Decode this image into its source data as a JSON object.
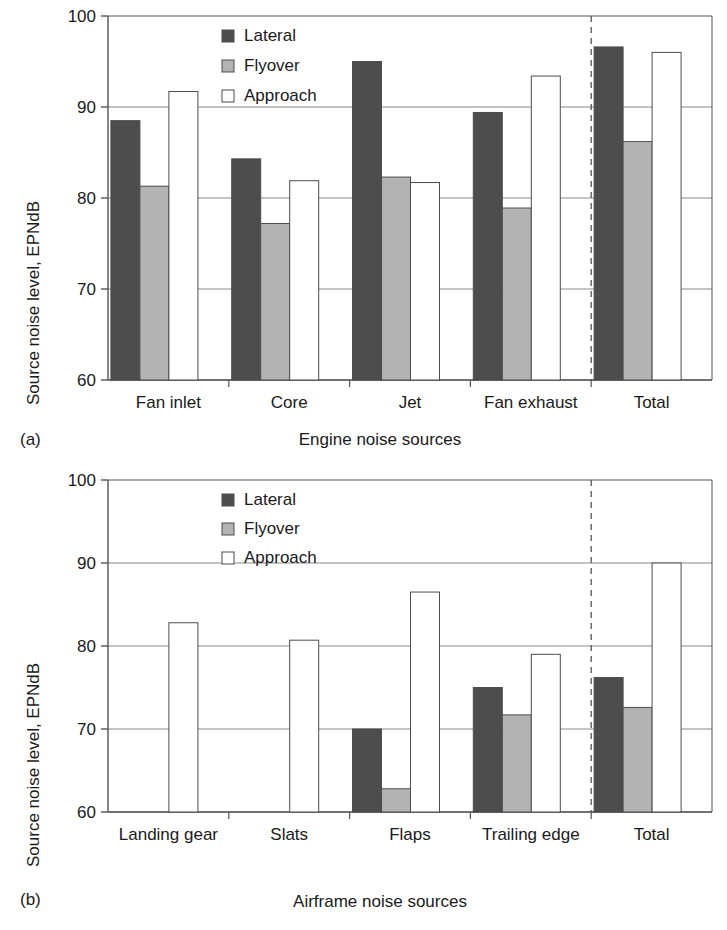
{
  "figure": {
    "panels": [
      {
        "tag": "(a)",
        "xlabel": "Engine noise sources",
        "ylabel": "Source noise level, EPNdB"
      },
      {
        "tag": "(b)",
        "xlabel": "Airframe noise sources",
        "ylabel": "Source noise level, EPNdB"
      }
    ]
  },
  "legend": {
    "position": "top-center",
    "entries": [
      {
        "label": "Lateral",
        "color": "#4d4d4d"
      },
      {
        "label": "Flyover",
        "color": "#b3b3b3"
      },
      {
        "label": "Approach",
        "color": "#ffffff"
      }
    ]
  },
  "colors": {
    "lateral": "#4d4d4d",
    "flyover": "#b3b3b3",
    "approach": "#ffffff",
    "bar_outline": "#4d4d4d",
    "axis": "#555555",
    "grid": "#888888",
    "divider": "#555555"
  },
  "chart_data": [
    {
      "type": "bar",
      "title": "",
      "panel": "(a)",
      "xlabel": "Engine noise sources",
      "ylabel": "Source noise level, EPNdB",
      "ylim": [
        60,
        100
      ],
      "yticks": [
        60,
        70,
        80,
        90,
        100
      ],
      "ytick_labels": [
        "60",
        "70",
        "80",
        "90",
        "100"
      ],
      "grid": true,
      "legend": [
        "Lateral",
        "Flyover",
        "Approach"
      ],
      "legend_position": "upper center",
      "divider_after_category": "Fan exhaust",
      "categories": [
        "Fan inlet",
        "Core",
        "Jet",
        "Fan exhaust",
        "Total"
      ],
      "series": [
        {
          "name": "Lateral",
          "values": [
            88.5,
            84.3,
            95.0,
            89.4,
            96.6
          ]
        },
        {
          "name": "Flyover",
          "values": [
            81.3,
            77.2,
            82.3,
            78.9,
            86.2
          ]
        },
        {
          "name": "Approach",
          "values": [
            91.7,
            81.9,
            81.7,
            93.4,
            96.0
          ]
        }
      ]
    },
    {
      "type": "bar",
      "title": "",
      "panel": "(b)",
      "xlabel": "Airframe noise sources",
      "ylabel": "Source noise level, EPNdB",
      "ylim": [
        60,
        100
      ],
      "yticks": [
        60,
        70,
        80,
        90,
        100
      ],
      "ytick_labels": [
        "60",
        "70",
        "80",
        "90",
        "100"
      ],
      "grid": true,
      "legend": [
        "Lateral",
        "Flyover",
        "Approach"
      ],
      "legend_position": "upper center",
      "divider_after_category": "Trailing edge",
      "categories": [
        "Landing gear",
        "Slats",
        "Flaps",
        "Trailing edge",
        "Total"
      ],
      "series": [
        {
          "name": "Lateral",
          "values": [
            null,
            null,
            70.0,
            75.0,
            76.2
          ]
        },
        {
          "name": "Flyover",
          "values": [
            null,
            null,
            62.8,
            71.7,
            72.6
          ]
        },
        {
          "name": "Approach",
          "values": [
            82.8,
            80.7,
            86.5,
            79.0,
            90.0
          ]
        }
      ]
    }
  ]
}
